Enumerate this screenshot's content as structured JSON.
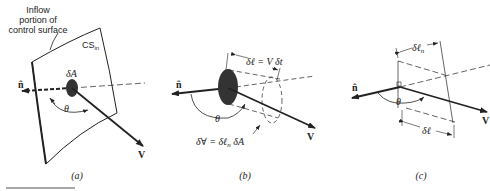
{
  "figure": {
    "panels": [
      {
        "id": "a",
        "caption": "(a)",
        "labels": {
          "callout": [
            "Inflow",
            "portion of",
            "control surface"
          ],
          "surface": "CS",
          "surface_sub": "in",
          "area": "δA",
          "normal": "n̂",
          "angle": "θ",
          "velocity": "V"
        }
      },
      {
        "id": "b",
        "caption": "(b)",
        "labels": {
          "length": "δℓ = V δt",
          "volume": "δ∀ = δℓ",
          "volume_sub": "n",
          "volume_tail": " δA",
          "normal": "n̂",
          "angle": "θ",
          "velocity": "V"
        }
      },
      {
        "id": "c",
        "caption": "(c)",
        "labels": {
          "normal_length": "δℓ",
          "normal_length_sub": "n",
          "length": "δℓ",
          "normal": "n̂",
          "angle": "θ",
          "velocity": "V"
        }
      }
    ]
  }
}
